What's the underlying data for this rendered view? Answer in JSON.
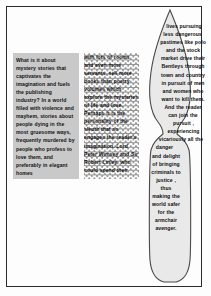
{
  "page": {
    "background_color": "#fdfdfd",
    "border_color": "#2b2b2b"
  },
  "columns": {
    "shaded_box": {
      "name": "shaded text box",
      "fill_color": "#c9c9c9",
      "text": "What is it about mystery stories that captivates the imagination and fuels the publishing industry? In a world filled with violence and mayhem, stories about people dying in the most gruesome ways, frequently murdered  by people who profess to love them, and preferably in elegant homes"
    },
    "patterned_box": {
      "name": "scalloped pattern text box",
      "pattern": "fish-scale",
      "pattern_color": "#8f8f8f",
      "text": "with lots of rooms and even more servants, sell more books than poetry volumes which explore the mysteries of life and love. Perhaps it is the personality of the sleuth that so engages the reader's imagination. Lord Peter Wimsey and Sir Robert Linley, who could spend their"
    },
    "vase_shape": {
      "name": "vase shaped text flow",
      "fill_color": "#e8e8e8",
      "outline_color": "#4a4a4a",
      "text": "lives pursuing less dangerous pastimes like polo and the stock market drive their Bentleys through town and country in pursuit of men and women who want to kill them. And the reader can join the pursuit , experiencing vicariously all the danger and delight of bringing criminals to justice , thus making the world safer for the armchair avenger."
    }
  }
}
